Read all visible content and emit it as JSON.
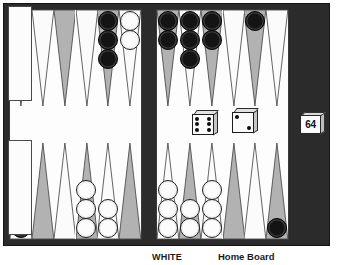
{
  "app": {
    "title": "Backgammon Board"
  },
  "labels": {
    "white": "WHITE",
    "home_board": "Home Board"
  },
  "doubling_cube": {
    "name": "doubling-cube",
    "value": "64"
  },
  "dice": [
    {
      "name": "die-left",
      "value": 6
    },
    {
      "name": "die-right",
      "value": 2
    }
  ],
  "colors": {
    "frame": "#2b2b2b",
    "play_field": "#fdfdfd",
    "point_dark": "#b2b2b2",
    "point_light": "#fbfbfb",
    "checker_black": "#141414",
    "checker_white": "#fcfcfc"
  },
  "bar": {
    "black_on_bar": 0,
    "white_on_bar": 0
  },
  "trays": {
    "top_label": "black-bear-off-tray",
    "top_count": 0,
    "bottom_label": "white-bear-off-tray",
    "bottom_count": 0
  },
  "board": {
    "quadrants": {
      "top_left": {
        "points": [
          {
            "index": 1,
            "shade": "dark",
            "checkers": 0,
            "color": ""
          },
          {
            "index": 2,
            "shade": "light",
            "checkers": 0,
            "color": ""
          },
          {
            "index": 3,
            "shade": "dark",
            "checkers": 0,
            "color": ""
          },
          {
            "index": 4,
            "shade": "light",
            "checkers": 0,
            "color": ""
          },
          {
            "index": 5,
            "shade": "dark",
            "checkers": 3,
            "color": "black"
          },
          {
            "index": 6,
            "shade": "light",
            "checkers": 2,
            "color": "white"
          }
        ]
      },
      "top_right": {
        "points": [
          {
            "index": 7,
            "shade": "dark",
            "checkers": 2,
            "color": "black"
          },
          {
            "index": 8,
            "shade": "light",
            "checkers": 3,
            "color": "black"
          },
          {
            "index": 9,
            "shade": "dark",
            "checkers": 2,
            "color": "black"
          },
          {
            "index": 10,
            "shade": "light",
            "checkers": 0,
            "color": ""
          },
          {
            "index": 11,
            "shade": "dark",
            "checkers": 1,
            "color": "black"
          },
          {
            "index": 12,
            "shade": "light",
            "checkers": 0,
            "color": ""
          }
        ]
      },
      "bottom_left": {
        "points": [
          {
            "index": 13,
            "shade": "light",
            "checkers": 3,
            "color": "black"
          },
          {
            "index": 14,
            "shade": "dark",
            "checkers": 0,
            "color": ""
          },
          {
            "index": 15,
            "shade": "light",
            "checkers": 0,
            "color": ""
          },
          {
            "index": 16,
            "shade": "dark",
            "checkers": 3,
            "color": "white"
          },
          {
            "index": 17,
            "shade": "light",
            "checkers": 2,
            "color": "white"
          },
          {
            "index": 18,
            "shade": "dark",
            "checkers": 0,
            "color": ""
          }
        ]
      },
      "bottom_right": {
        "points": [
          {
            "index": 19,
            "shade": "light",
            "checkers": 3,
            "color": "white"
          },
          {
            "index": 20,
            "shade": "dark",
            "checkers": 2,
            "color": "white"
          },
          {
            "index": 21,
            "shade": "light",
            "checkers": 3,
            "color": "white"
          },
          {
            "index": 22,
            "shade": "dark",
            "checkers": 0,
            "color": ""
          },
          {
            "index": 23,
            "shade": "light",
            "checkers": 0,
            "color": ""
          },
          {
            "index": 24,
            "shade": "dark",
            "checkers": 1,
            "color": "black"
          }
        ]
      }
    }
  }
}
